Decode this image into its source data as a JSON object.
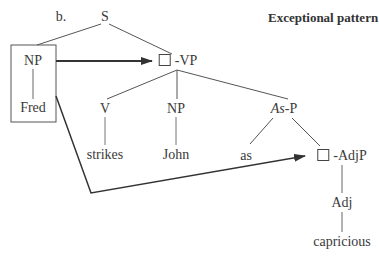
{
  "diagram": {
    "label": "b.",
    "title": "Exceptional pattern",
    "type": "syntax-tree",
    "nodes": {
      "root": "S",
      "subject_np": "NP",
      "subject_word": "Fred",
      "vp": "-VP",
      "v": "V",
      "v_word": "strikes",
      "object_np": "NP",
      "object_word": "John",
      "asp_italic": "As",
      "asp_suffix": "-P",
      "as_word": "as",
      "adjp": "-AdjP",
      "adj": "Adj",
      "adj_word": "capricious"
    },
    "edges": [
      [
        "S",
        "NP"
      ],
      [
        "S",
        "-VP"
      ],
      [
        "NP",
        "Fred"
      ],
      [
        "-VP",
        "V"
      ],
      [
        "-VP",
        "NP(John)"
      ],
      [
        "-VP",
        "As-P"
      ],
      [
        "V",
        "strikes"
      ],
      [
        "NP(John)",
        "John"
      ],
      [
        "As-P",
        "as"
      ],
      [
        "As-P",
        "-AdjP"
      ],
      [
        "-AdjP",
        "Adj"
      ],
      [
        "Adj",
        "capricious"
      ]
    ],
    "arrows": [
      {
        "from": "NP[Fred] box",
        "to": "-VP empty slot"
      },
      {
        "from": "NP[Fred] box",
        "to": "-AdjP empty slot"
      }
    ],
    "colors": {
      "line": "#444444",
      "arrow": "#333333",
      "text": "#3a3a3a"
    }
  }
}
